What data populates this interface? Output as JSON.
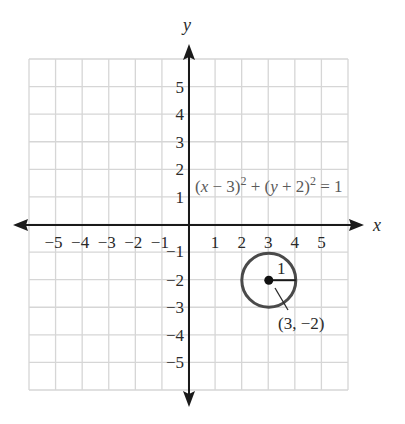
{
  "graph": {
    "x_axis_label": "x",
    "y_axis_label": "y",
    "x_ticks": [
      {
        "value": -5,
        "label": "−5"
      },
      {
        "value": -4,
        "label": "−4"
      },
      {
        "value": -3,
        "label": "−3"
      },
      {
        "value": -2,
        "label": "−2"
      },
      {
        "value": -1,
        "label": "−1"
      },
      {
        "value": 1,
        "label": "1"
      },
      {
        "value": 2,
        "label": "2"
      },
      {
        "value": 3,
        "label": "3"
      },
      {
        "value": 4,
        "label": "4"
      },
      {
        "value": 5,
        "label": "5"
      }
    ],
    "y_ticks": [
      {
        "value": 5,
        "label": "5"
      },
      {
        "value": 4,
        "label": "4"
      },
      {
        "value": 3,
        "label": "3"
      },
      {
        "value": 2,
        "label": "2"
      },
      {
        "value": 1,
        "label": "1"
      },
      {
        "value": -1,
        "label": "−1"
      },
      {
        "value": -2,
        "label": "−2"
      },
      {
        "value": -3,
        "label": "−3"
      },
      {
        "value": -4,
        "label": "−4"
      },
      {
        "value": -5,
        "label": "−5"
      }
    ],
    "range": {
      "x": [
        -6,
        6
      ],
      "y": [
        -6,
        6
      ]
    },
    "equation": {
      "part1": "(",
      "x": "x",
      "part2": " − 3)",
      "exp1": "2",
      "part3": " + (",
      "y": "y",
      "part4": " + 2)",
      "exp2": "2",
      "part5": " = 1"
    },
    "circle": {
      "center": [
        3,
        -2
      ],
      "radius": 1,
      "radius_label": "1",
      "center_label": "(3, −2)"
    },
    "colors": {
      "grid": "#d6d6d6",
      "axis": "#1a1a1a",
      "circle": "#4a4a4a",
      "equation_text": "#5a5a5a"
    }
  }
}
